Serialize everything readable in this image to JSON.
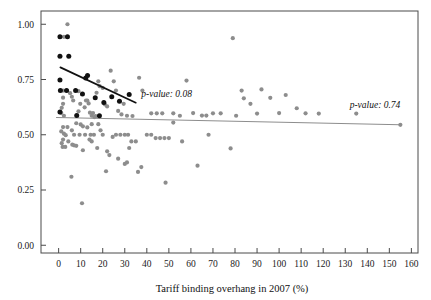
{
  "chart_data": {
    "type": "scatter",
    "title": "",
    "subtitle": "",
    "xlabel": "Tariff binding overhang in 2007 (%)",
    "ylabel": "",
    "xlim": [
      -8,
      163
    ],
    "ylim": [
      -0.035,
      1.06
    ],
    "grid": false,
    "legend_position": "none",
    "xticks": [
      0,
      10,
      20,
      30,
      40,
      50,
      60,
      70,
      80,
      90,
      100,
      110,
      120,
      130,
      140,
      150,
      160
    ],
    "xtick_labels": [
      "0",
      "10",
      "20",
      "30",
      "40",
      "50",
      "60",
      "70",
      "80",
      "90",
      "100",
      "110",
      "120",
      "130",
      "140",
      "150",
      "160"
    ],
    "yticks": [
      0.0,
      0.25,
      0.5,
      0.75,
      1.0
    ],
    "ytick_labels": [
      "0.00",
      "0.25",
      "0.50",
      "0.75",
      "1.00"
    ],
    "colors": {
      "highlight_points": "#111111",
      "normal_points": "#8d8d8d",
      "highlight_fit_line": "#111111",
      "normal_fit_line": "#8d8d8d",
      "frame": "#4a4a4a"
    },
    "annotations": [
      {
        "name": "p-value-black-line",
        "text": "p-value: 0.08",
        "x": 37.5,
        "y": 0.672,
        "style": "italic"
      },
      {
        "name": "p-value-grey-line",
        "text": "p-value: 0.74",
        "x": 132.0,
        "y": 0.622,
        "style": "italic"
      }
    ],
    "series": [
      {
        "name": "fit-line-black",
        "type": "line",
        "color": "#111111",
        "x": [
          0.8,
          35.0
        ],
        "y": [
          0.805,
          0.645
        ]
      },
      {
        "name": "fit-line-grey",
        "type": "line",
        "color": "#8d8d8d",
        "x": [
          -1.0,
          155.0
        ],
        "y": [
          0.578,
          0.545
        ]
      },
      {
        "name": "highlighted-countries",
        "type": "scatter",
        "color": "#111111",
        "points": [
          [
            0.6,
            0.943
          ],
          [
            4.0,
            0.943
          ],
          [
            0.6,
            0.855
          ],
          [
            4.6,
            0.855
          ],
          [
            0.6,
            0.748
          ],
          [
            12.3,
            0.757
          ],
          [
            13.1,
            0.768
          ],
          [
            0.8,
            0.7
          ],
          [
            3.6,
            0.7
          ],
          [
            7.7,
            0.7
          ],
          [
            10.8,
            0.685
          ],
          [
            16.6,
            0.668
          ],
          [
            24.1,
            0.672
          ],
          [
            20.5,
            0.646
          ],
          [
            27.6,
            0.652
          ],
          [
            32.0,
            0.682
          ],
          [
            0.6,
            0.603
          ],
          [
            8.2,
            0.587
          ],
          [
            18.5,
            0.586
          ]
        ]
      },
      {
        "name": "other-countries",
        "type": "scatter",
        "color": "#8d8d8d",
        "points": [
          [
            4.0,
            1.0
          ],
          [
            2.4,
            0.943
          ],
          [
            2.0,
            0.7
          ],
          [
            2.0,
            0.668
          ],
          [
            2.0,
            0.64
          ],
          [
            1.4,
            0.622
          ],
          [
            1.2,
            0.598
          ],
          [
            2.4,
            0.586
          ],
          [
            5.2,
            0.688
          ],
          [
            6.0,
            0.672
          ],
          [
            6.6,
            0.655
          ],
          [
            9.0,
            0.697
          ],
          [
            9.8,
            0.64
          ],
          [
            9.0,
            0.606
          ],
          [
            11.8,
            0.624
          ],
          [
            12.4,
            0.655
          ],
          [
            13.0,
            0.655
          ],
          [
            13.6,
            0.642
          ],
          [
            14.2,
            0.6
          ],
          [
            15.0,
            0.586
          ],
          [
            15.6,
            0.598
          ],
          [
            16.2,
            0.58
          ],
          [
            16.8,
            0.584
          ],
          [
            18.0,
            0.742
          ],
          [
            18.6,
            0.72
          ],
          [
            17.2,
            0.69
          ],
          [
            20.0,
            0.712
          ],
          [
            21.0,
            0.637
          ],
          [
            22.0,
            0.628
          ],
          [
            23.6,
            0.79
          ],
          [
            25.0,
            0.742
          ],
          [
            26.0,
            0.7
          ],
          [
            27.0,
            0.608
          ],
          [
            28.5,
            0.592
          ],
          [
            29.5,
            0.64
          ],
          [
            31.0,
            0.586
          ],
          [
            33.5,
            0.585
          ],
          [
            36.5,
            0.758
          ],
          [
            38.0,
            0.7
          ],
          [
            42.0,
            0.597
          ],
          [
            44.5,
            0.597
          ],
          [
            47.0,
            0.597
          ],
          [
            52.0,
            0.597
          ],
          [
            55.0,
            0.586
          ],
          [
            58.0,
            0.745
          ],
          [
            61.0,
            0.598
          ],
          [
            65.0,
            0.587
          ],
          [
            67.0,
            0.587
          ],
          [
            70.0,
            0.597
          ],
          [
            73.5,
            0.597
          ],
          [
            79.0,
            0.937
          ],
          [
            80.5,
            0.586
          ],
          [
            83.0,
            0.7
          ],
          [
            84.0,
            0.665
          ],
          [
            87.0,
            0.64
          ],
          [
            90.0,
            0.596
          ],
          [
            92.0,
            0.705
          ],
          [
            96.0,
            0.667
          ],
          [
            100.0,
            0.598
          ],
          [
            103.0,
            0.68
          ],
          [
            108.0,
            0.62
          ],
          [
            112.0,
            0.597
          ],
          [
            118.0,
            0.596
          ],
          [
            135.0,
            0.596
          ],
          [
            155.0,
            0.545
          ],
          [
            2.0,
            0.535
          ],
          [
            4.0,
            0.535
          ],
          [
            6.0,
            0.52
          ],
          [
            1.2,
            0.515
          ],
          [
            2.4,
            0.505
          ],
          [
            3.2,
            0.498
          ],
          [
            2.0,
            0.478
          ],
          [
            4.4,
            0.47
          ],
          [
            1.4,
            0.462
          ],
          [
            7.0,
            0.5
          ],
          [
            9.5,
            0.5
          ],
          [
            12.0,
            0.5
          ],
          [
            14.5,
            0.5
          ],
          [
            16.0,
            0.5
          ],
          [
            8.0,
            0.552
          ],
          [
            10.0,
            0.547
          ],
          [
            11.0,
            0.538
          ],
          [
            13.0,
            0.533
          ],
          [
            15.0,
            0.548
          ],
          [
            6.2,
            0.455
          ],
          [
            7.0,
            0.452
          ],
          [
            8.0,
            0.45
          ],
          [
            14.0,
            0.478
          ],
          [
            15.0,
            0.47
          ],
          [
            18.0,
            0.548
          ],
          [
            19.0,
            0.52
          ],
          [
            20.0,
            0.5
          ],
          [
            22.0,
            0.425
          ],
          [
            23.0,
            0.408
          ],
          [
            24.5,
            0.49
          ],
          [
            26.0,
            0.5
          ],
          [
            28.0,
            0.5
          ],
          [
            30.0,
            0.5
          ],
          [
            31.5,
            0.5
          ],
          [
            27.0,
            0.392
          ],
          [
            32.0,
            0.44
          ],
          [
            33.0,
            0.47
          ],
          [
            35.0,
            0.47
          ],
          [
            36.0,
            0.332
          ],
          [
            37.5,
            0.354
          ],
          [
            40.0,
            0.5
          ],
          [
            42.0,
            0.5
          ],
          [
            44.0,
            0.485
          ],
          [
            46.0,
            0.485
          ],
          [
            48.0,
            0.485
          ],
          [
            50.0,
            0.485
          ],
          [
            52.0,
            0.555
          ],
          [
            56.0,
            0.47
          ],
          [
            63.0,
            0.36
          ],
          [
            68.0,
            0.5
          ],
          [
            78.0,
            0.438
          ],
          [
            5.8,
            0.31
          ],
          [
            10.6,
            0.19
          ],
          [
            21.5,
            0.335
          ],
          [
            48.5,
            0.283
          ],
          [
            30.0,
            0.368
          ],
          [
            31.0,
            0.375
          ],
          [
            1.8,
            0.445
          ],
          [
            3.0,
            0.445
          ],
          [
            17.5,
            0.44
          ],
          [
            11.0,
            0.43
          ]
        ]
      }
    ]
  },
  "axis": {
    "x_title": "Tariff binding overhang in 2007 (%)"
  }
}
